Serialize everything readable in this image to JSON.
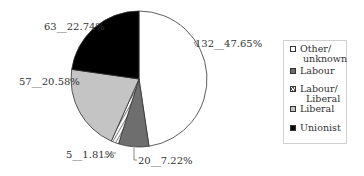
{
  "chart_data": {
    "type": "pie",
    "title": "",
    "categories": [
      "Other/ unknown",
      "Labour",
      "Labour/ Liberal",
      "Liberal",
      "Unionist"
    ],
    "values": [
      132,
      20,
      5,
      57,
      63
    ],
    "percentages": [
      47.65,
      7.22,
      1.81,
      20.58,
      22.74
    ],
    "data_labels": [
      "132__47.65%",
      "20__7.22%",
      "5__1.81%",
      "57__20.58%",
      "63__22.74%"
    ],
    "colors": [
      "#ffffff",
      "#6e6e6e",
      "hatched",
      "#c4c4c4",
      "#000000"
    ],
    "start_angle": "12 o'clock",
    "direction": "clockwise",
    "legend_position": "right"
  },
  "labels": {
    "other": "132__47.65%",
    "labour": "20__7.22%",
    "labour_liberal": "5__1.81%",
    "liberal": "57__20.58%",
    "unionist": "63__22.74%"
  },
  "legend": {
    "items": [
      {
        "line1": "Other/",
        "line2": "unknown"
      },
      {
        "line1": "Labour"
      },
      {
        "line1": "Labour/",
        "line2": "Liberal"
      },
      {
        "line1": "Liberal"
      },
      {
        "line1": "Unionist"
      }
    ]
  }
}
